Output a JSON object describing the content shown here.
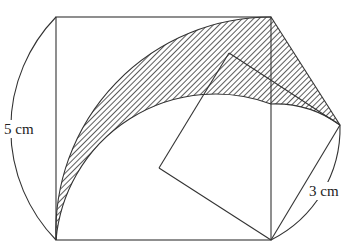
{
  "figure": {
    "type": "geometry-diagram",
    "labels": {
      "large_side": "5 cm",
      "small_side": "3 cm"
    },
    "colors": {
      "stroke": "#333333",
      "hatch": "#333333",
      "background": "#ffffff"
    }
  }
}
